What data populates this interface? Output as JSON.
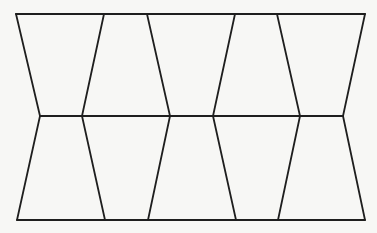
{
  "diagram": {
    "stroke_color": "#1e1e1e",
    "background": "#f7f7f5",
    "rows": 2,
    "shapes_per_row": 5,
    "horizontal_lines": [
      {
        "name": "top-edge",
        "x1": 16,
        "y1": 14,
        "x2": 365,
        "y2": 14
      },
      {
        "name": "middle-edge",
        "x1": 40,
        "y1": 116,
        "x2": 343,
        "y2": 116
      },
      {
        "name": "bottom-edge",
        "x1": 17,
        "y1": 220,
        "x2": 365,
        "y2": 220
      }
    ],
    "top_row_slants": [
      {
        "x1": 16,
        "y1": 14,
        "x2": 40,
        "y2": 116
      },
      {
        "x1": 104,
        "y1": 14,
        "x2": 82,
        "y2": 116
      },
      {
        "x1": 147,
        "y1": 14,
        "x2": 170,
        "y2": 116
      },
      {
        "x1": 235,
        "y1": 14,
        "x2": 213,
        "y2": 116
      },
      {
        "x1": 277,
        "y1": 14,
        "x2": 300,
        "y2": 116
      },
      {
        "x1": 365,
        "y1": 14,
        "x2": 343,
        "y2": 116
      }
    ],
    "bottom_row_slants": [
      {
        "x1": 40,
        "y1": 116,
        "x2": 17,
        "y2": 220
      },
      {
        "x1": 82,
        "y1": 116,
        "x2": 105,
        "y2": 220
      },
      {
        "x1": 170,
        "y1": 116,
        "x2": 148,
        "y2": 220
      },
      {
        "x1": 213,
        "y1": 116,
        "x2": 236,
        "y2": 220
      },
      {
        "x1": 300,
        "y1": 116,
        "x2": 278,
        "y2": 220
      },
      {
        "x1": 343,
        "y1": 116,
        "x2": 365,
        "y2": 220
      }
    ]
  }
}
